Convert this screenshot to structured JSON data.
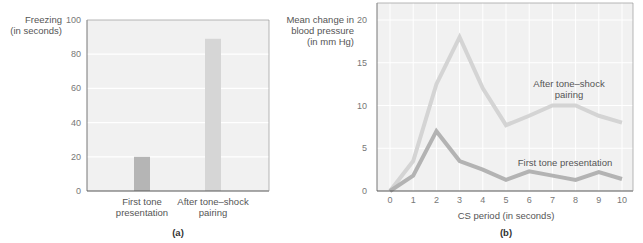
{
  "chart_data": [
    {
      "type": "bar",
      "panel": "(a)",
      "title": "",
      "ylabel": "Freezing (in seconds)",
      "ylabel_lines": [
        "Freezing",
        "(in seconds)"
      ],
      "xlabel": "",
      "categories": [
        "First tone presentation",
        "After tone–shock pairing"
      ],
      "category_lines": [
        [
          "First tone",
          "presentation"
        ],
        [
          "After tone–shock",
          "pairing"
        ]
      ],
      "values": [
        20,
        89
      ],
      "ylim": [
        0,
        100
      ],
      "yticks": [
        0,
        20,
        40,
        60,
        80,
        100
      ],
      "grid": true,
      "colors": [
        "#b5b5b5",
        "#d6d6d6"
      ]
    },
    {
      "type": "line",
      "panel": "(b)",
      "title": "",
      "ylabel": "Mean change in blood pressure (in mm Hg)",
      "ylabel_lines": [
        "Mean change in",
        "blood pressure",
        "(in mm Hg)"
      ],
      "xlabel": "CS period (in seconds)",
      "x": [
        0,
        1,
        2,
        3,
        4,
        5,
        6,
        7,
        8,
        9,
        10
      ],
      "series": [
        {
          "name": "After tone–shock pairing",
          "label_lines": [
            "After tone–shock",
            "pairing"
          ],
          "values": [
            0,
            3.5,
            12.5,
            18,
            12,
            7.7,
            8.8,
            10,
            10,
            8.8,
            8
          ],
          "color": "#d4d4d4"
        },
        {
          "name": "First tone presentation",
          "label_lines": [
            "First tone presentation"
          ],
          "values": [
            0,
            1.8,
            7,
            3.5,
            2.5,
            1.3,
            2.3,
            1.8,
            1.3,
            2.2,
            1.4
          ],
          "color": "#b3b3b3"
        }
      ],
      "ylim": [
        0,
        22
      ],
      "yticks": [
        0,
        5,
        10,
        15,
        20
      ],
      "xticks": [
        0,
        1,
        2,
        3,
        4,
        5,
        6,
        7,
        8,
        9,
        10
      ],
      "grid": true,
      "legend": "inline labels"
    }
  ]
}
